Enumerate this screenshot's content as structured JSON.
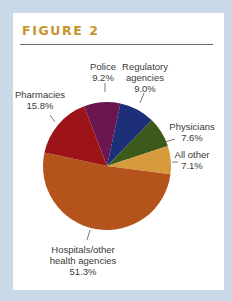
{
  "figure": {
    "title": "FIGURE 2"
  },
  "chart_data": {
    "type": "pie",
    "title": "FIGURE 2",
    "center": [
      107,
      166
    ],
    "radius": 64,
    "start_angle_deg": -21,
    "slices": [
      {
        "label": "Police",
        "label_lines": [
          "Police"
        ],
        "value": 9.2,
        "value_text": "9.2%",
        "color": "#6b1650"
      },
      {
        "label": "Regulatory agencies",
        "label_lines": [
          "Regulatory",
          "agencies"
        ],
        "value": 9.0,
        "value_text": "9.0%",
        "color": "#1c2f78"
      },
      {
        "label": "Physicians",
        "label_lines": [
          "Physicians"
        ],
        "value": 7.6,
        "value_text": "7.6%",
        "color": "#3c5a1c"
      },
      {
        "label": "All other",
        "label_lines": [
          "All other"
        ],
        "value": 7.1,
        "value_text": "7.1%",
        "color": "#d69b3c"
      },
      {
        "label": "Hospitals/other health agencies",
        "label_lines": [
          "Hospitals/other",
          "health agencies"
        ],
        "value": 51.3,
        "value_text": "51.3%",
        "color": "#b4531c"
      },
      {
        "label": "Pharmacies",
        "label_lines": [
          "Pharmacies"
        ],
        "value": 15.8,
        "value_text": "15.8%",
        "color": "#9c1418"
      }
    ],
    "labels_layout": [
      {
        "x": 103,
        "y": 61,
        "leader": [
          [
            105,
            83
          ],
          [
            105,
            92
          ]
        ]
      },
      {
        "x": 145,
        "y": 61,
        "leader": [
          [
            144,
            93
          ],
          [
            140,
            103
          ]
        ]
      },
      {
        "x": 192,
        "y": 121,
        "leader": [
          [
            175,
            139
          ],
          [
            165,
            142
          ]
        ]
      },
      {
        "x": 192,
        "y": 149,
        "leader": [
          [
            178,
            162
          ],
          [
            172,
            162
          ]
        ]
      },
      {
        "x": 83,
        "y": 244,
        "leader": [
          [
            87,
            240
          ],
          [
            90,
            230
          ]
        ]
      },
      {
        "x": 40,
        "y": 89,
        "leader": [
          [
            50,
            115
          ],
          [
            55,
            122
          ]
        ]
      }
    ]
  }
}
